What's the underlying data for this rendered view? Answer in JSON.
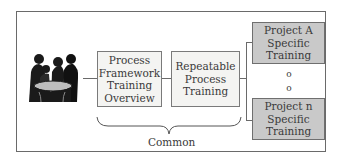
{
  "diagram": {
    "image": {
      "icon": "people-meeting-icon",
      "description": "group of people around a table"
    },
    "boxes": [
      {
        "id": "process-framework",
        "lines": [
          "Process",
          "Framework",
          "Training",
          "Overview"
        ],
        "fill": "#f4f4f2"
      },
      {
        "id": "repeatable-process",
        "lines": [
          "Repeatable",
          "Process",
          "Training"
        ],
        "fill": "#f4f4f2"
      },
      {
        "id": "project-a",
        "lines": [
          "Project A",
          "Specific",
          "Training"
        ],
        "fill": "#c9c9c9"
      },
      {
        "id": "project-n",
        "lines": [
          "Project n",
          "Specific",
          "Training"
        ],
        "fill": "#c9c9c9"
      }
    ],
    "ellipsis": [
      "o",
      "o"
    ],
    "brace_label": "Common"
  }
}
